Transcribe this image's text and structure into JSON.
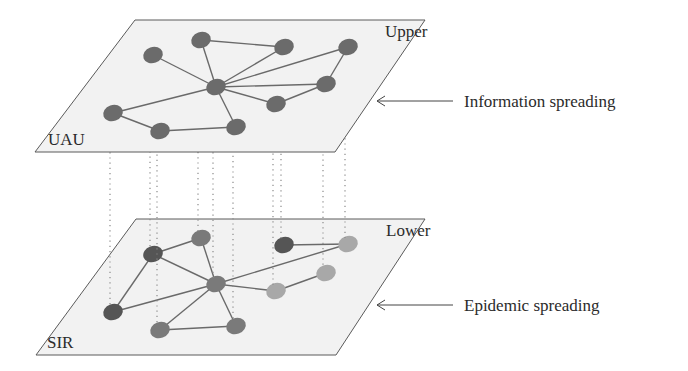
{
  "diagram": {
    "type": "multiplex-network",
    "upper_layer": {
      "name": "Upper",
      "model": "UAU",
      "description": "Information spreading",
      "corners": [
        [
          135,
          20
        ],
        [
          425,
          20
        ],
        [
          335,
          152
        ],
        [
          35,
          152
        ]
      ],
      "node_color": "#6b6b6b",
      "nodes": [
        {
          "id": "A",
          "x": 153,
          "y": 55
        },
        {
          "id": "B",
          "x": 201,
          "y": 40
        },
        {
          "id": "C",
          "x": 284,
          "y": 47
        },
        {
          "id": "D",
          "x": 348,
          "y": 47
        },
        {
          "id": "E",
          "x": 216,
          "y": 87
        },
        {
          "id": "F",
          "x": 326,
          "y": 84
        },
        {
          "id": "G",
          "x": 276,
          "y": 104
        },
        {
          "id": "H",
          "x": 113,
          "y": 113
        },
        {
          "id": "I",
          "x": 160,
          "y": 131
        },
        {
          "id": "J",
          "x": 236,
          "y": 127
        }
      ],
      "edges": [
        [
          "E",
          "A"
        ],
        [
          "E",
          "B"
        ],
        [
          "B",
          "C"
        ],
        [
          "E",
          "C"
        ],
        [
          "E",
          "D"
        ],
        [
          "E",
          "F"
        ],
        [
          "E",
          "G"
        ],
        [
          "G",
          "F"
        ],
        [
          "F",
          "D"
        ],
        [
          "E",
          "H"
        ],
        [
          "H",
          "I"
        ],
        [
          "I",
          "J"
        ],
        [
          "J",
          "E"
        ]
      ]
    },
    "lower_layer": {
      "name": "Lower",
      "model": "SIR",
      "description": "Epidemic spreading",
      "corners": [
        [
          136,
          219
        ],
        [
          425,
          219
        ],
        [
          336,
          355
        ],
        [
          36,
          355
        ]
      ],
      "state_colors": {
        "dark": "#555555",
        "mid": "#7a7a7a",
        "light": "#a8a8a8"
      },
      "nodes": [
        {
          "id": "a",
          "x": 153,
          "y": 254,
          "state": "dark"
        },
        {
          "id": "b",
          "x": 201,
          "y": 238,
          "state": "mid"
        },
        {
          "id": "c",
          "x": 284,
          "y": 245,
          "state": "dark"
        },
        {
          "id": "d",
          "x": 348,
          "y": 244,
          "state": "light"
        },
        {
          "id": "e",
          "x": 216,
          "y": 284,
          "state": "mid"
        },
        {
          "id": "f",
          "x": 326,
          "y": 273,
          "state": "light"
        },
        {
          "id": "g",
          "x": 276,
          "y": 291,
          "state": "light"
        },
        {
          "id": "h",
          "x": 113,
          "y": 312,
          "state": "dark"
        },
        {
          "id": "i",
          "x": 160,
          "y": 330,
          "state": "mid"
        },
        {
          "id": "j",
          "x": 236,
          "y": 326,
          "state": "mid"
        }
      ],
      "edges": [
        [
          "a",
          "b"
        ],
        [
          "b",
          "e"
        ],
        [
          "a",
          "e"
        ],
        [
          "e",
          "g"
        ],
        [
          "a",
          "h"
        ],
        [
          "h",
          "e"
        ],
        [
          "e",
          "i"
        ],
        [
          "e",
          "j"
        ],
        [
          "i",
          "j"
        ],
        [
          "e",
          "d"
        ],
        [
          "c",
          "d"
        ],
        [
          "g",
          "f"
        ]
      ]
    },
    "interlayer_links": [
      {
        "x": 110
      },
      {
        "x": 149
      },
      {
        "x": 162
      },
      {
        "x": 198
      },
      {
        "x": 213
      },
      {
        "x": 233
      },
      {
        "x": 271
      },
      {
        "x": 287
      },
      {
        "x": 329
      },
      {
        "x": 352
      }
    ],
    "labels": {
      "upper_corner": "Upper",
      "upper_model": "UAU",
      "lower_corner": "Lower",
      "lower_model": "SIR",
      "information": "Information spreading",
      "epidemic": "Epidemic spreading"
    }
  }
}
